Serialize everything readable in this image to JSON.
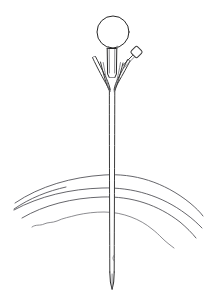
{
  "document": {
    "title": "Anatomical Line Drawing",
    "subject": "needle-device-in-tissue",
    "background_color": "#ffffff",
    "ink_color": "#3a3a3a",
    "ink_color_dark": "#262626",
    "ink_color_soft": "#55555a",
    "ink_color_faint": "#6e6e74",
    "width": 210,
    "height": 301
  },
  "figure": {
    "name": "needle-penetrating-tissue-layers",
    "style": "black-and-white-line-art",
    "parts": [
      {
        "id": "balloon",
        "label": "Balloon reservoir",
        "shape": "circle",
        "cx": 113,
        "cy": 32,
        "r": 16
      },
      {
        "id": "hub",
        "label": "Hub barrel",
        "shape": "rectangle",
        "x": 107,
        "y": 48,
        "width": 10,
        "height": 28
      },
      {
        "id": "left-wing",
        "label": "Left flange wing",
        "shape": "tapered-v"
      },
      {
        "id": "right-wing",
        "label": "Right flange wing",
        "shape": "tapered-v"
      },
      {
        "id": "side-port",
        "label": "Side port valve",
        "shape": "rounded-diamond",
        "cx": 136,
        "cy": 52,
        "size": 8,
        "rotation": 45
      },
      {
        "id": "shaft",
        "label": "Needle shaft",
        "shape": "long-tube",
        "x_left": 109,
        "x_right": 115,
        "y_top": 88,
        "y_bottom": 282
      },
      {
        "id": "needle-tip",
        "label": "Bevelled needle tip",
        "shape": "point",
        "x": 112,
        "y": 289
      },
      {
        "id": "tissue-arc-1",
        "label": "Outer tissue layer arc",
        "shape": "arc"
      },
      {
        "id": "tissue-arc-2",
        "label": "Short inner arc fragment",
        "shape": "arc"
      },
      {
        "id": "tissue-arc-3",
        "label": "Middle tissue layer arc",
        "shape": "arc"
      },
      {
        "id": "tissue-arc-4",
        "label": "Lower tissue layer arc",
        "shape": "arc"
      },
      {
        "id": "tissue-arc-5",
        "label": "Deep irregular tissue arc",
        "shape": "arc-irregular"
      }
    ]
  }
}
